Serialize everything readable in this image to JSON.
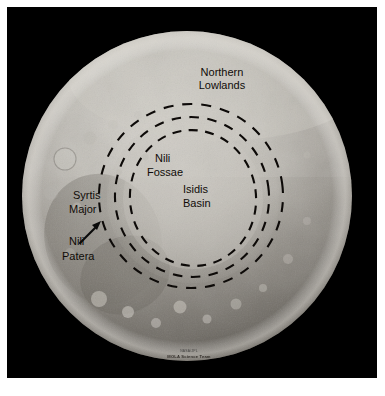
{
  "figure": {
    "kind": "annotated-planetary-image",
    "background_color": "#000000",
    "border_color": "#ffffff"
  },
  "globe": {
    "center_x": 187,
    "center_y": 196,
    "radius": 165,
    "limb_color_light": "#c9c6c0",
    "limb_color_dark": "#4a4641"
  },
  "labels": {
    "northern_lowlands": {
      "line1": "Northern",
      "line2": "Lowlands",
      "x": 222,
      "y": 72
    },
    "nili_fossae": {
      "line1": "Nili",
      "line2": "Fossae",
      "x": 138,
      "y": 160
    },
    "isidis_basin": {
      "line1": "Isidis",
      "line2": "Basin",
      "x": 183,
      "y": 190
    },
    "syrtis_major": {
      "line1": "Syrtis",
      "line2": "Major",
      "x": 72,
      "y": 198
    },
    "nili_patera": {
      "line1": "Nili",
      "line2": "Patera",
      "x": 68,
      "y": 253
    }
  },
  "rings": {
    "description": "three concentric dashed rings marking Isidis impact basin scarps",
    "items": [
      {
        "name": "inner-ring",
        "cx": 193,
        "cy": 198,
        "rx": 63,
        "ry": 68,
        "rotation": -8
      },
      {
        "name": "middle-ring",
        "cx": 192,
        "cy": 197,
        "rx": 77,
        "ry": 80,
        "rotation": -8
      },
      {
        "name": "outer-ring",
        "cx": 191,
        "cy": 196,
        "rx": 92,
        "ry": 92,
        "rotation": -8
      }
    ]
  },
  "arrow": {
    "name": "nili-patera-pointer",
    "from_x": 80,
    "from_y": 243,
    "to_x": 101,
    "to_y": 222
  },
  "credit": {
    "line1": "NASA/JPL",
    "line2": "MOLA Science Team",
    "x": 186,
    "y": 355
  },
  "colors": {
    "label_text": "#100c08",
    "ring_stroke": "#0d0a08",
    "plate_background": "#000000",
    "page_background": "#ffffff"
  }
}
